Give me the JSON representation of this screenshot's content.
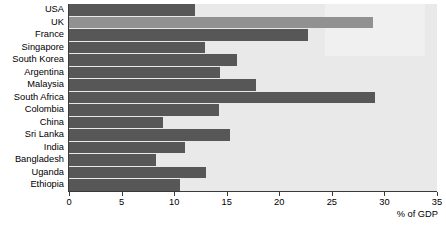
{
  "chart_data": {
    "type": "bar",
    "orientation": "horizontal",
    "title": "",
    "subtitle": "",
    "xlabel": "% of GDP",
    "ylabel": "",
    "xlim": [
      0,
      35
    ],
    "xticks": [
      0,
      5,
      10,
      15,
      20,
      25,
      30,
      35
    ],
    "grid": false,
    "legend": null,
    "categories": [
      "USA",
      "UK",
      "France",
      "Singapore",
      "South Korea",
      "Argentina",
      "Malaysia",
      "South Africa",
      "Colombia",
      "China",
      "Sri Lanka",
      "India",
      "Bangladesh",
      "Uganda",
      "Ethiopia"
    ],
    "values": [
      12.0,
      28.9,
      22.7,
      12.9,
      16.0,
      14.4,
      17.8,
      29.1,
      14.3,
      8.9,
      15.3,
      11.0,
      8.3,
      13.0,
      10.6
    ],
    "bar_colors": [
      "#575757",
      "#919191",
      "#575757",
      "#575757",
      "#575757",
      "#575757",
      "#575757",
      "#575757",
      "#575757",
      "#575757",
      "#575757",
      "#575757",
      "#575757",
      "#575757",
      "#575757"
    ],
    "plot_background": "#e9e9e9",
    "axis_color": "#3a3a3a",
    "highlight_color": "#919191"
  }
}
